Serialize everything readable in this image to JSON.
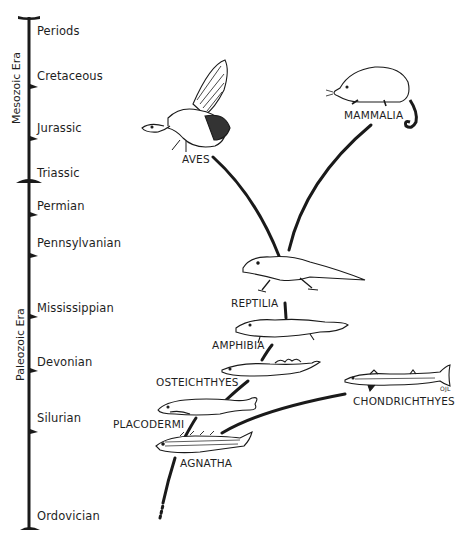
{
  "diagram": {
    "type": "phylogenetic-tree-with-geologic-timescale",
    "timescale": {
      "header": "Periods",
      "eras": [
        {
          "name": "Mesozoic Era"
        },
        {
          "name": "Paleozoic Era"
        }
      ],
      "periods": [
        {
          "name": "Cretaceous",
          "era": "Mesozoic Era"
        },
        {
          "name": "Jurassic",
          "era": "Mesozoic Era"
        },
        {
          "name": "Triassic",
          "era": "Mesozoic Era"
        },
        {
          "name": "Permian",
          "era": "Paleozoic Era"
        },
        {
          "name": "Pennsylvanian",
          "era": "Paleozoic Era"
        },
        {
          "name": "Mississippian",
          "era": "Paleozoic Era"
        },
        {
          "name": "Devonian",
          "era": "Paleozoic Era"
        },
        {
          "name": "Silurian",
          "era": "Paleozoic Era"
        },
        {
          "name": "Ordovician",
          "era": "Paleozoic Era"
        }
      ]
    },
    "taxa": [
      {
        "name": "AVES",
        "illustration": "bird-archaeopteryx"
      },
      {
        "name": "MAMMALIA",
        "illustration": "opossum-like-mammal"
      },
      {
        "name": "REPTILIA",
        "illustration": "lizard-like-reptile"
      },
      {
        "name": "AMPHIBIA",
        "illustration": "salamander-like-amphibian"
      },
      {
        "name": "OSTEICHTHYES",
        "illustration": "lobe-finned-fish"
      },
      {
        "name": "CHONDRICHTHYES",
        "illustration": "shark"
      },
      {
        "name": "PLACODERMI",
        "illustration": "armored-fish"
      },
      {
        "name": "AGNATHA",
        "illustration": "jawless-fish"
      }
    ],
    "signature": "OJL"
  }
}
